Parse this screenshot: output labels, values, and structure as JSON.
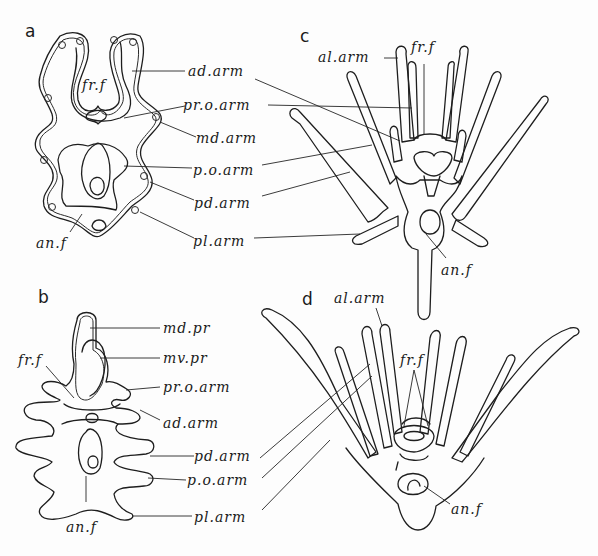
{
  "figure": {
    "panels": [
      {
        "id": "a",
        "letter": "a",
        "labels": [
          "fr.f",
          "ad.arm",
          "pr.o.arm",
          "md.arm",
          "p.o.arm",
          "pd.arm",
          "an.f",
          "pl.arm"
        ]
      },
      {
        "id": "b",
        "letter": "b",
        "labels": [
          "md.pr",
          "fr.f",
          "mv.pr",
          "pr.o.arm",
          "ad.arm",
          "pd.arm",
          "p.o.arm",
          "an.f",
          "pl.arm"
        ]
      },
      {
        "id": "c",
        "letter": "c",
        "labels": [
          "al.arm",
          "fr.f",
          "an.f"
        ]
      },
      {
        "id": "d",
        "letter": "d",
        "labels": [
          "al.arm",
          "fr.f",
          "an.f"
        ]
      }
    ]
  }
}
